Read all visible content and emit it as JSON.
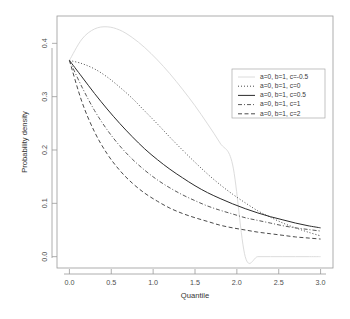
{
  "chart_data": {
    "type": "line",
    "title": "",
    "xlabel": "Quantile",
    "ylabel": "Probability density",
    "xlim": [
      0.0,
      3.0
    ],
    "ylim": [
      0.0,
      0.43
    ],
    "grid": false,
    "legend_position": "top-right",
    "xticks": [
      "0.0",
      "0.5",
      "1.0",
      "1.5",
      "2.0",
      "2.5",
      "3.0"
    ],
    "xtick_values": [
      0.0,
      0.5,
      1.0,
      1.5,
      2.0,
      2.5,
      3.0
    ],
    "yticks": [
      "0.0",
      "0.1",
      "0.2",
      "0.3",
      "0.4"
    ],
    "ytick_values": [
      0.0,
      0.1,
      0.2,
      0.3,
      0.4
    ],
    "x": [
      0.0,
      0.15,
      0.3,
      0.45,
      0.6,
      0.75,
      0.9,
      1.05,
      1.2,
      1.35,
      1.5,
      1.65,
      1.8,
      1.95,
      2.1,
      2.25,
      2.4,
      2.55,
      2.7,
      2.85,
      3.0
    ],
    "series": [
      {
        "name": "a=0, b=1, c=-0.5",
        "label": "a=0, b=1, c=-0.5",
        "linestyle": "solid",
        "color": "#dcdcdc",
        "width": 1.0,
        "dasharray": "",
        "values": [
          0.368,
          0.408,
          0.427,
          0.431,
          0.425,
          0.411,
          0.392,
          0.369,
          0.343,
          0.314,
          0.283,
          0.249,
          0.213,
          0.172,
          0.0,
          0.0,
          0.0,
          0.0,
          0.0,
          0.0,
          0.0
        ],
        "note": "drops to zero at x=2.0 and stays at zero to x=3.0"
      },
      {
        "name": "a=0, b=1, c=0",
        "label": "a=0, b=1, c=0",
        "linestyle": "dotted",
        "color": "#4a4a4a",
        "width": 1.0,
        "dasharray": "1,2",
        "values": [
          0.368,
          0.362,
          0.352,
          0.337,
          0.318,
          0.297,
          0.273,
          0.249,
          0.224,
          0.2,
          0.177,
          0.155,
          0.135,
          0.117,
          0.101,
          0.086,
          0.074,
          0.063,
          0.054,
          0.046,
          0.039
        ]
      },
      {
        "name": "a=0, b=1, c=0.5",
        "label": "a=0, b=1, c=0.5",
        "linestyle": "solid",
        "color": "#2b2b2b",
        "width": 1.0,
        "dasharray": "",
        "values": [
          0.368,
          0.337,
          0.306,
          0.277,
          0.25,
          0.225,
          0.202,
          0.182,
          0.164,
          0.148,
          0.133,
          0.12,
          0.109,
          0.099,
          0.09,
          0.082,
          0.075,
          0.069,
          0.063,
          0.058,
          0.054
        ]
      },
      {
        "name": "a=0, b=1, c=1",
        "label": "a=0, b=1, c=1",
        "linestyle": "dashdot",
        "color": "#5a5a5a",
        "width": 1.0,
        "dasharray": "4,2,1,2",
        "values": [
          0.368,
          0.318,
          0.274,
          0.238,
          0.208,
          0.183,
          0.162,
          0.144,
          0.129,
          0.116,
          0.105,
          0.095,
          0.087,
          0.08,
          0.073,
          0.068,
          0.063,
          0.058,
          0.054,
          0.051,
          0.048
        ]
      },
      {
        "name": "a=0, b=1, c=2",
        "label": "a=0, b=1, c=2",
        "linestyle": "dashed",
        "color": "#4a4a4a",
        "width": 1.0,
        "dasharray": "4,2.5",
        "values": [
          0.368,
          0.29,
          0.234,
          0.193,
          0.162,
          0.138,
          0.119,
          0.104,
          0.091,
          0.081,
          0.073,
          0.066,
          0.059,
          0.054,
          0.05,
          0.046,
          0.043,
          0.04,
          0.037,
          0.035,
          0.033
        ]
      }
    ]
  },
  "axes": {
    "xlabel": "Quantile",
    "ylabel": "Probability density"
  }
}
